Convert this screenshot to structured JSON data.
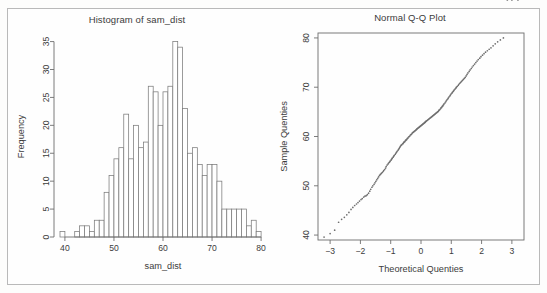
{
  "page": {
    "background": "#fdfdfc",
    "frame_color": "#b9b9b9",
    "axis_color": "#6e6e6e",
    "bar_stroke": "#7b7b7b",
    "bar_fill": "#ffffff",
    "point_color": "#6f6f6f"
  },
  "chart_data": [
    {
      "type": "bar",
      "id": "histogram",
      "title": "Histogram of sam_dist",
      "xlabel": "sam_dist",
      "ylabel": "Frequency",
      "xlim": [
        39,
        81
      ],
      "ylim": [
        0,
        36
      ],
      "xticks": [
        40,
        50,
        60,
        70,
        80
      ],
      "xticklabels": [
        "40",
        "50",
        "60",
        "70",
        "80"
      ],
      "yticks": [
        0,
        5,
        10,
        15,
        20,
        25,
        30,
        35
      ],
      "yticklabels": [
        "0",
        "5",
        "10",
        "15",
        "20",
        "25",
        "30",
        "35"
      ],
      "grid": false,
      "legend": "none",
      "bin_width": 1,
      "bin_starts": [
        39,
        40,
        41,
        42,
        43,
        44,
        45,
        46,
        47,
        48,
        49,
        50,
        51,
        52,
        53,
        54,
        55,
        56,
        57,
        58,
        59,
        60,
        61,
        62,
        63,
        64,
        65,
        66,
        67,
        68,
        69,
        70,
        71,
        72,
        73,
        74,
        75,
        76,
        77,
        78,
        79
      ],
      "categories": [
        "39-40",
        "40-41",
        "41-42",
        "42-43",
        "43-44",
        "44-45",
        "45-46",
        "46-47",
        "47-48",
        "48-49",
        "49-50",
        "50-51",
        "51-52",
        "52-53",
        "53-54",
        "54-55",
        "55-56",
        "56-57",
        "57-58",
        "58-59",
        "59-60",
        "60-61",
        "61-62",
        "62-63",
        "63-64",
        "64-65",
        "65-66",
        "66-67",
        "67-68",
        "68-69",
        "69-70",
        "70-71",
        "71-72",
        "72-73",
        "73-74",
        "74-75",
        "75-76",
        "76-77",
        "77-78",
        "78-79",
        "79-80"
      ],
      "values": [
        1,
        0,
        0,
        1,
        2,
        2,
        1,
        3,
        3,
        8,
        11,
        14,
        16,
        22,
        14,
        20,
        16,
        17,
        27,
        26,
        20,
        26,
        27,
        35,
        34,
        23,
        15,
        16,
        13,
        11,
        13,
        13,
        10,
        5,
        5,
        5,
        5,
        5,
        2,
        3,
        1
      ]
    },
    {
      "type": "scatter",
      "id": "qq-plot",
      "title": "Normal Q-Q Plot",
      "xlabel": "Theoretical Quenties",
      "ylabel": "Sample Quenties",
      "xlim": [
        -3.4,
        3.4
      ],
      "ylim": [
        39,
        81
      ],
      "xticks": [
        -3,
        -2,
        -1,
        0,
        1,
        2,
        3
      ],
      "xticklabels": [
        "−3",
        "−2",
        "−1",
        "0",
        "1",
        "2",
        "3"
      ],
      "yticks": [
        40,
        50,
        60,
        70,
        80
      ],
      "yticklabels": [
        "40",
        "50",
        "60",
        "70",
        "80"
      ],
      "grid": false,
      "legend": "none",
      "x": [
        -3.2,
        -3.0,
        -2.85,
        -2.72,
        -2.62,
        -2.53,
        -2.45,
        -2.38,
        -2.31,
        -2.25,
        -2.19,
        -2.13,
        -2.08,
        -2.03,
        -1.98,
        -1.94,
        -1.89,
        -1.85,
        -1.81,
        -1.77,
        -1.73,
        -1.69,
        -1.66,
        -1.62,
        -1.59,
        -1.55,
        -1.52,
        -1.49,
        -1.46,
        -1.43,
        -1.4,
        -1.37,
        -1.34,
        -1.31,
        -1.28,
        -1.25,
        -1.23,
        -1.2,
        -1.17,
        -1.15,
        -1.12,
        -1.09,
        -1.07,
        -1.04,
        -1.02,
        -0.99,
        -0.97,
        -0.95,
        -0.92,
        -0.9,
        -0.88,
        -0.85,
        -0.83,
        -0.81,
        -0.79,
        -0.76,
        -0.74,
        -0.72,
        -0.7,
        -0.68,
        -0.66,
        -0.64,
        -0.61,
        -0.59,
        -0.57,
        -0.55,
        -0.53,
        -0.51,
        -0.49,
        -0.47,
        -0.45,
        -0.43,
        -0.41,
        -0.39,
        -0.37,
        -0.35,
        -0.33,
        -0.31,
        -0.29,
        -0.27,
        -0.25,
        -0.23,
        -0.21,
        -0.19,
        -0.17,
        -0.15,
        -0.14,
        -0.12,
        -0.1,
        -0.08,
        -0.06,
        -0.04,
        -0.02,
        0.0,
        0.02,
        0.04,
        0.06,
        0.08,
        0.1,
        0.12,
        0.14,
        0.15,
        0.17,
        0.19,
        0.21,
        0.23,
        0.25,
        0.27,
        0.29,
        0.31,
        0.33,
        0.35,
        0.37,
        0.39,
        0.41,
        0.43,
        0.45,
        0.47,
        0.49,
        0.51,
        0.53,
        0.55,
        0.57,
        0.59,
        0.61,
        0.64,
        0.66,
        0.68,
        0.7,
        0.72,
        0.74,
        0.76,
        0.79,
        0.81,
        0.83,
        0.85,
        0.88,
        0.9,
        0.92,
        0.95,
        0.97,
        0.99,
        1.02,
        1.04,
        1.07,
        1.09,
        1.12,
        1.15,
        1.17,
        1.2,
        1.23,
        1.25,
        1.28,
        1.31,
        1.34,
        1.37,
        1.4,
        1.43,
        1.46,
        1.49,
        1.52,
        1.55,
        1.59,
        1.62,
        1.66,
        1.69,
        1.73,
        1.77,
        1.81,
        1.85,
        1.89,
        1.94,
        1.98,
        2.03,
        2.08,
        2.13,
        2.19,
        2.25,
        2.31,
        2.38,
        2.45,
        2.53,
        2.62,
        2.72,
        2.85,
        3.0,
        3.2
      ],
      "y": [
        39.6,
        40.3,
        41.0,
        42.6,
        43.2,
        43.6,
        44.1,
        44.6,
        45.2,
        45.6,
        46.0,
        46.3,
        46.6,
        46.9,
        47.2,
        47.4,
        47.7,
        47.9,
        48.0,
        48.2,
        48.5,
        48.9,
        49.3,
        49.7,
        50.0,
        50.3,
        50.6,
        50.9,
        51.2,
        51.5,
        51.8,
        52.1,
        52.3,
        52.5,
        52.7,
        52.9,
        53.1,
        53.3,
        53.6,
        53.9,
        54.2,
        54.4,
        54.6,
        54.8,
        55.0,
        55.2,
        55.4,
        55.6,
        55.8,
        56.0,
        56.2,
        56.4,
        56.6,
        56.8,
        57.0,
        57.2,
        57.4,
        57.6,
        57.8,
        58.0,
        58.2,
        58.3,
        58.5,
        58.6,
        58.8,
        58.9,
        59.0,
        59.2,
        59.3,
        59.4,
        59.6,
        59.7,
        59.9,
        60.0,
        60.1,
        60.3,
        60.4,
        60.5,
        60.7,
        60.8,
        60.9,
        61.0,
        61.1,
        61.2,
        61.3,
        61.4,
        61.5,
        61.6,
        61.7,
        61.8,
        61.9,
        62.0,
        62.1,
        62.2,
        62.3,
        62.4,
        62.5,
        62.6,
        62.7,
        62.8,
        62.9,
        63.0,
        63.1,
        63.2,
        63.3,
        63.4,
        63.5,
        63.6,
        63.7,
        63.8,
        63.9,
        64.0,
        64.1,
        64.2,
        64.3,
        64.4,
        64.5,
        64.6,
        64.7,
        64.8,
        64.9,
        65.0,
        65.1,
        65.3,
        65.4,
        65.6,
        65.8,
        65.9,
        66.1,
        66.2,
        66.4,
        66.6,
        66.8,
        67.0,
        67.2,
        67.4,
        67.6,
        67.8,
        68.0,
        68.2,
        68.4,
        68.6,
        68.8,
        69.0,
        69.2,
        69.4,
        69.6,
        69.8,
        70.0,
        70.2,
        70.4,
        70.6,
        70.8,
        71.0,
        71.2,
        71.4,
        71.6,
        71.8,
        72.0,
        72.3,
        72.6,
        72.9,
        73.2,
        73.5,
        73.8,
        74.1,
        74.4,
        74.7,
        75.0,
        75.3,
        75.6,
        75.9,
        76.2,
        76.5,
        76.8,
        77.1,
        77.4,
        77.7,
        78.0,
        78.4,
        78.8,
        79.2,
        79.6,
        80.0
      ]
    }
  ]
}
